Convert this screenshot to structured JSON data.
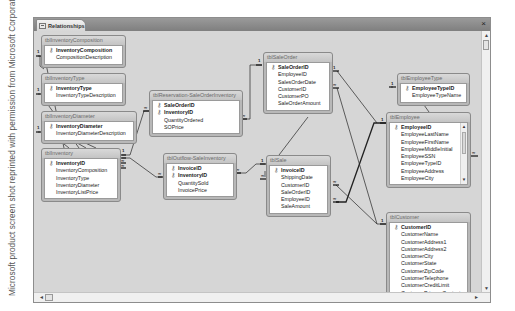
{
  "credit": "Microsoft product screen shot reprinted with permission from Microsoft Corporation.",
  "window": {
    "tab_label": "Relationships",
    "close_glyph": "×"
  },
  "scroll": {
    "up": "▲",
    "down": "▼",
    "left": "◄",
    "right": "►"
  },
  "key_glyph": "⚷",
  "tables": [
    {
      "name": "tblInventoryComposition",
      "fields": [
        {
          "name": "InventoryComposition",
          "pk": true
        },
        {
          "name": "CompositionDescription",
          "pk": false
        }
      ]
    },
    {
      "name": "tblInventoryType",
      "fields": [
        {
          "name": "InventoryType",
          "pk": true
        },
        {
          "name": "InventoryTypeDescription",
          "pk": false
        }
      ]
    },
    {
      "name": "tblInventoryDiameter",
      "fields": [
        {
          "name": "InventoryDiameter",
          "pk": true
        },
        {
          "name": "InventoryDiameterDescription",
          "pk": false
        }
      ]
    },
    {
      "name": "tblInventory",
      "fields": [
        {
          "name": "InventoryID",
          "pk": true
        },
        {
          "name": "InventoryComposition",
          "pk": false
        },
        {
          "name": "InventoryType",
          "pk": false
        },
        {
          "name": "InventoryDiameter",
          "pk": false
        },
        {
          "name": "InventoryListPrice",
          "pk": false
        }
      ]
    },
    {
      "name": "tblReservation-SaleOrderInventory",
      "fields": [
        {
          "name": "SaleOrderID",
          "pk": true
        },
        {
          "name": "InventoryID",
          "pk": true
        },
        {
          "name": "QuantityOrdered",
          "pk": false
        },
        {
          "name": "SOPrice",
          "pk": false
        }
      ]
    },
    {
      "name": "tblOutflow-SaleInventory",
      "fields": [
        {
          "name": "InvoiceID",
          "pk": true
        },
        {
          "name": "InventoryID",
          "pk": true
        },
        {
          "name": "QuantitySold",
          "pk": false
        },
        {
          "name": "InvoicePrice",
          "pk": false
        }
      ]
    },
    {
      "name": "tblSaleOrder",
      "fields": [
        {
          "name": "SaleOrderID",
          "pk": true
        },
        {
          "name": "EmployeeID",
          "pk": false
        },
        {
          "name": "SalesOrderDate",
          "pk": false
        },
        {
          "name": "CustomerID",
          "pk": false
        },
        {
          "name": "CustomerPO",
          "pk": false
        },
        {
          "name": "SaleOrderAmount",
          "pk": false
        }
      ]
    },
    {
      "name": "tblSale",
      "fields": [
        {
          "name": "InvoiceID",
          "pk": true
        },
        {
          "name": "ShippingDate",
          "pk": false
        },
        {
          "name": "CustomerID",
          "pk": false
        },
        {
          "name": "SaleOrderID",
          "pk": false
        },
        {
          "name": "EmployeeID",
          "pk": false
        },
        {
          "name": "SaleAmount",
          "pk": false
        }
      ]
    },
    {
      "name": "tblEmployeeType",
      "fields": [
        {
          "name": "EmployeeTypeID",
          "pk": true
        },
        {
          "name": "EmployeeTypeName",
          "pk": false
        }
      ]
    },
    {
      "name": "tblEmployee",
      "fields": [
        {
          "name": "EmployeeID",
          "pk": true
        },
        {
          "name": "EmployeeLastName",
          "pk": false
        },
        {
          "name": "EmployeeFirstName",
          "pk": false
        },
        {
          "name": "EmployeeMiddleInitial",
          "pk": false
        },
        {
          "name": "EmployeeSSN",
          "pk": false
        },
        {
          "name": "EmployeeTypeID",
          "pk": false
        },
        {
          "name": "EmployeeAddress",
          "pk": false
        },
        {
          "name": "EmployeeCity",
          "pk": false
        }
      ]
    },
    {
      "name": "tblCustomer",
      "fields": [
        {
          "name": "CustomerID",
          "pk": true
        },
        {
          "name": "CustomerName",
          "pk": false
        },
        {
          "name": "CustomerAddress1",
          "pk": false
        },
        {
          "name": "CustomerAddress2",
          "pk": false
        },
        {
          "name": "CustomerCity",
          "pk": false
        },
        {
          "name": "CustomerState",
          "pk": false
        },
        {
          "name": "CustomerZipCode",
          "pk": false
        },
        {
          "name": "CustomerTelephone",
          "pk": false
        },
        {
          "name": "CustomerCreditLimit",
          "pk": false
        },
        {
          "name": "CustomerPrimaryContact",
          "pk": false
        }
      ]
    }
  ],
  "cardinality": {
    "one": "1",
    "many": "∞"
  }
}
